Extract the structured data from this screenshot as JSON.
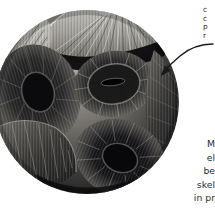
{
  "figure": {
    "kind": "scanning-electron-micrograph",
    "color_mode": "grayscale",
    "background_color": "#ffffff",
    "alt": "Scanning electron micrograph of a spherical coccosphere built from overlapping disc-shaped coccolith plates with radiating ridges"
  },
  "annotations": {
    "callout": {
      "name": "callout-label",
      "truncated": true,
      "lines": [
        "c",
        "c",
        "p",
        "r"
      ],
      "text": "c\nc\np\nr"
    },
    "caption": {
      "name": "caption-label",
      "truncated": true,
      "lines": [
        "M",
        "el",
        "be",
        "skel",
        "in pr"
      ],
      "text": "M\nel\nbe\nskel\nin pr"
    },
    "arrow": {
      "name": "pointer-arrow",
      "shape": "curved",
      "direction": "right-to-lower-left",
      "color": "#1a1a1a"
    }
  },
  "palette": {
    "background": "#ffffff",
    "text": "#2b2b2b",
    "arrow": "#1a1a1a",
    "specimen_highlight": "#d8d6d2",
    "specimen_midtone": "#8e8c88",
    "specimen_shadow": "#3a3a38",
    "specimen_deep_shadow": "#17171a",
    "specimen_rim": "#b9b7b3"
  }
}
